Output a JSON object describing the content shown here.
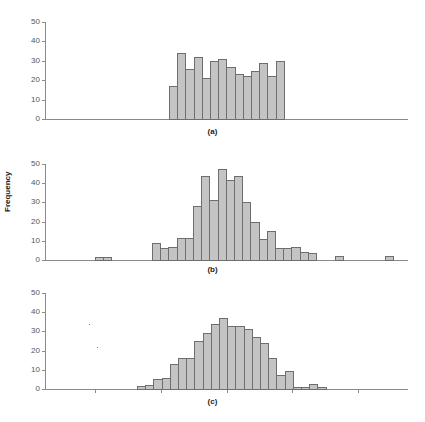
{
  "chart_data": [
    {
      "type": "bar",
      "title": "",
      "caption": "(a)",
      "xlabel": "",
      "ylabel": "",
      "ylim": [
        0,
        50
      ],
      "yticks": [
        0,
        10,
        20,
        30,
        40,
        50
      ],
      "grid": false,
      "bin_start_px": 169,
      "bin_width_px": 8.2,
      "values": [
        17,
        34,
        26,
        32,
        21,
        30,
        31,
        27,
        23,
        22,
        25,
        29,
        22,
        30
      ],
      "outliers": []
    },
    {
      "type": "bar",
      "title": "",
      "caption": "(b)",
      "xlabel": "",
      "ylabel": "Frequency",
      "ylim": [
        0,
        50
      ],
      "yticks": [
        0,
        10,
        20,
        30,
        40,
        50
      ],
      "grid": false,
      "bin_start_px": 152,
      "bin_width_px": 8.2,
      "values": [
        9,
        6,
        7,
        11.5,
        11.5,
        28,
        43.5,
        31,
        47.5,
        41.5,
        44,
        30,
        20,
        11,
        15,
        6,
        6,
        7,
        4,
        3.5
      ],
      "outliers": [
        {
          "x_px": 95,
          "value": 1.5
        },
        {
          "x_px": 103,
          "value": 1.5
        },
        {
          "x_px": 335,
          "value": 2
        },
        {
          "x_px": 385,
          "value": 2
        }
      ]
    },
    {
      "type": "bar",
      "title": "",
      "caption": "(c)",
      "xlabel": "",
      "ylabel": "",
      "ylim": [
        0,
        50
      ],
      "yticks": [
        0,
        10,
        20,
        30,
        40,
        50
      ],
      "grid": false,
      "bin_start_px": 137,
      "bin_width_px": 8.2,
      "values": [
        1.5,
        2,
        5,
        5.5,
        13,
        16,
        16,
        25,
        29,
        34,
        37,
        33,
        33,
        31,
        27,
        24,
        16,
        7.5,
        9.5,
        1,
        1,
        2.5,
        1
      ],
      "outliers": [],
      "xticks_px": [
        95,
        161,
        227,
        292,
        358
      ]
    }
  ],
  "labels": {
    "ylabel": "Frequency",
    "captions": [
      "(a)",
      "(b)",
      "(c)"
    ],
    "ytick_labels": [
      "0",
      "10",
      "20",
      "30",
      "40",
      "50"
    ]
  },
  "colors": {
    "bar_fill": "#c4c4c4",
    "bar_edge": "#6e6e6e",
    "axis": "#8a8a8a"
  }
}
